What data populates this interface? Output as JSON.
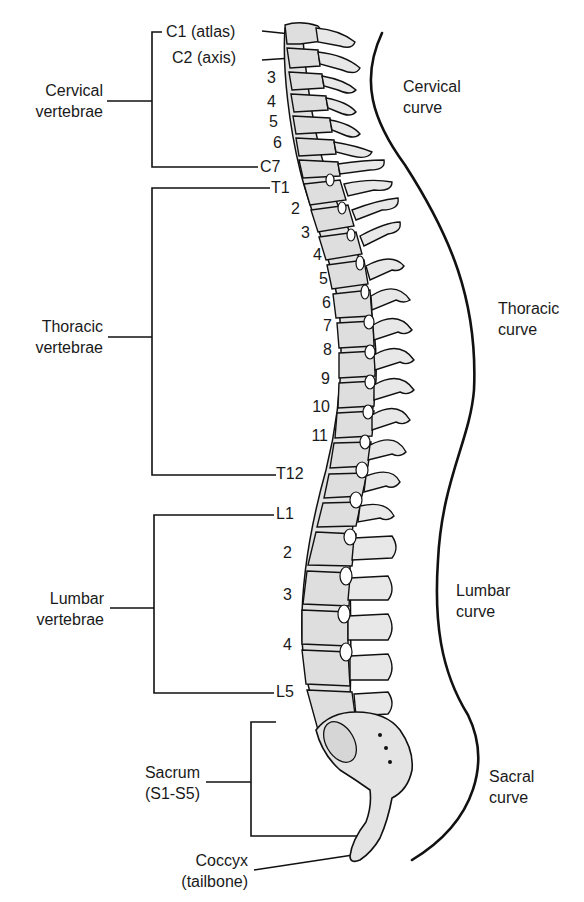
{
  "diagram": {
    "title": "",
    "colors": {
      "bone_fill": "#dcdcdc",
      "bone_light": "#ececec",
      "outline": "#111111",
      "disc": "#ffffff",
      "text": "#1a1a1a"
    }
  },
  "groups": {
    "cervical": {
      "line1": "Cervical",
      "line2": "vertebrae"
    },
    "thoracic": {
      "line1": "Thoracic",
      "line2": "vertebrae"
    },
    "lumbar": {
      "line1": "Lumbar",
      "line2": "vertebrae"
    },
    "sacrum": {
      "line1": "Sacrum",
      "line2": "(S1-S5)"
    },
    "coccyx": {
      "line1": "Coccyx",
      "line2": "(tailbone)"
    }
  },
  "curves": {
    "cervical": {
      "line1": "Cervical",
      "line2": "curve"
    },
    "thoracic": {
      "line1": "Thoracic",
      "line2": "curve"
    },
    "lumbar": {
      "line1": "Lumbar",
      "line2": "curve"
    },
    "sacral": {
      "line1": "Sacral",
      "line2": "curve"
    }
  },
  "vertebrae": {
    "cervical": [
      "C1 (atlas)",
      "C2 (axis)",
      "3",
      "4",
      "5",
      "6",
      "C7"
    ],
    "thoracic": [
      "T1",
      "2",
      "3",
      "4",
      "5",
      "6",
      "7",
      "8",
      "9",
      "10",
      "11",
      "T12"
    ],
    "lumbar": [
      "L1",
      "2",
      "3",
      "4",
      "L5"
    ]
  }
}
